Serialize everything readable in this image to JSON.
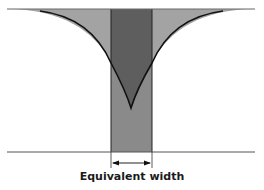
{
  "diagram": {
    "type": "equivalent-width-illustration",
    "caption": "Equivalent width",
    "colors": {
      "background": "#ffffff",
      "line_profile_fill": "#a0a0a0",
      "rectangle_fill": "#6e6e6e",
      "rectangle_lower_fill": "#8a8a8a",
      "overlap_fill": "#5a5a5a",
      "stroke": "#1a1a1a",
      "continuum_line": "#555555"
    },
    "elements": {
      "continuum_line": {
        "x1": 7,
        "x2": 255,
        "y": 9
      },
      "baseline": {
        "x1": 7,
        "x2": 255,
        "y": 152
      },
      "rectangle": {
        "x": 111,
        "y": 9,
        "width": 41,
        "height": 143
      },
      "profile_tip": {
        "x": 131,
        "y": 108
      },
      "width_arrow": {
        "x1": 111,
        "x2": 152,
        "y": 163
      }
    }
  }
}
